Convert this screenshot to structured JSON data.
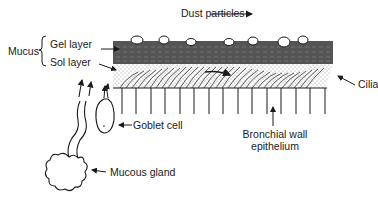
{
  "diagram": {
    "labels": {
      "dust_particles": "Dust particles",
      "mucus": "Mucus",
      "gel_layer": "Gel layer",
      "sol_layer": "Sol layer",
      "cilia": "Cilia",
      "goblet_cell": "Goblet cell",
      "bronchial_wall_line1": "Bronchial wall",
      "bronchial_wall_line2": "epithelium",
      "mucous_gland": "Mucous gland"
    },
    "colors": {
      "gel_layer_fill": "#555555",
      "line": "#1a1a1a",
      "background": "#ffffff"
    }
  }
}
